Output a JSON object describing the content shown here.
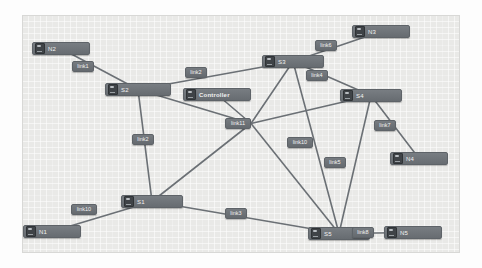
{
  "canvas": {
    "title": "network-topology-canvas",
    "background_color": "#e9e9e7",
    "node_color": "#6f7479",
    "edge_color": "#6b7075"
  },
  "nodes": [
    {
      "id": "N2",
      "label": "N2",
      "type": "host",
      "icon": "host-icon",
      "x": 10,
      "y": 27,
      "w": 58
    },
    {
      "id": "S2",
      "label": "S2",
      "type": "switch",
      "icon": "switch-icon",
      "x": 83,
      "y": 68,
      "w": 66
    },
    {
      "id": "S3",
      "label": "S3",
      "type": "switch",
      "icon": "switch-icon",
      "x": 240,
      "y": 40,
      "w": 62
    },
    {
      "id": "N3",
      "label": "N3",
      "type": "host",
      "icon": "host-icon",
      "x": 330,
      "y": 10,
      "w": 58
    },
    {
      "id": "Controller",
      "label": "Controller",
      "type": "controller",
      "icon": "controller-icon",
      "x": 161,
      "y": 73,
      "w": 68
    },
    {
      "id": "S4",
      "label": "S4",
      "type": "switch",
      "icon": "switch-icon",
      "x": 318,
      "y": 74,
      "w": 62
    },
    {
      "id": "N4",
      "label": "N4",
      "type": "host",
      "icon": "host-icon",
      "x": 368,
      "y": 137,
      "w": 58
    },
    {
      "id": "S1",
      "label": "S1",
      "type": "switch",
      "icon": "switch-icon",
      "x": 99,
      "y": 180,
      "w": 62
    },
    {
      "id": "N1",
      "label": "N1",
      "type": "host",
      "icon": "host-icon",
      "x": 1,
      "y": 210,
      "w": 58
    },
    {
      "id": "S5",
      "label": "S5",
      "type": "switch",
      "icon": "switch-icon",
      "x": 286,
      "y": 212,
      "w": 62
    },
    {
      "id": "N5",
      "label": "N5",
      "type": "host",
      "icon": "host-icon",
      "x": 362,
      "y": 211,
      "w": 58
    }
  ],
  "links": [
    {
      "id": "link1",
      "label": "link1",
      "from": "N2",
      "to": "S2",
      "lx": 50,
      "ly": 46
    },
    {
      "id": "link2",
      "label": "link2",
      "from": "S2",
      "to": "S3",
      "lx": 163,
      "ly": 52
    },
    {
      "id": "link6",
      "label": "link6",
      "from": "S3",
      "to": "N3",
      "lx": 293,
      "ly": 25
    },
    {
      "id": "link4",
      "label": "link4",
      "from": "S3",
      "to": "S4",
      "lx": 284,
      "ly": 55
    },
    {
      "id": "link7",
      "label": "link7",
      "from": "S4",
      "to": "N4",
      "lx": 352,
      "ly": 105
    },
    {
      "id": "link12",
      "label": "link2",
      "from": "S2",
      "to": "S1",
      "lx": 110,
      "ly": 119
    },
    {
      "id": "link10",
      "label": "link10",
      "from": "N1",
      "to": "S1",
      "lx": 49,
      "ly": 189
    },
    {
      "id": "link3",
      "label": "link3",
      "from": "S1",
      "to": "S5",
      "lx": 203,
      "ly": 193
    },
    {
      "id": "link8",
      "label": "link8",
      "from": "S5",
      "to": "N5",
      "lx": 330,
      "ly": 212
    },
    {
      "id": "link11",
      "label": "link11",
      "from": "hub",
      "to": "hub",
      "lx": 203,
      "ly": 103
    },
    {
      "id": "link10b",
      "label": "link10",
      "from": "S3",
      "to": "S5",
      "lx": 265,
      "ly": 122
    },
    {
      "id": "link5",
      "label": "link5",
      "from": "S4",
      "to": "S5",
      "lx": 302,
      "ly": 142
    }
  ],
  "edges": [
    {
      "from": "N2",
      "to": "S2"
    },
    {
      "from": "S2",
      "to": "S3"
    },
    {
      "from": "S3",
      "to": "N3"
    },
    {
      "from": "S3",
      "to": "S4"
    },
    {
      "from": "S4",
      "to": "N4"
    },
    {
      "from": "S2",
      "to": "S1"
    },
    {
      "from": "N1",
      "to": "S1"
    },
    {
      "from": "S1",
      "to": "S5"
    },
    {
      "from": "S5",
      "to": "N5"
    },
    {
      "from": "S2",
      "to": "hub"
    },
    {
      "from": "Controller",
      "to": "hub"
    },
    {
      "from": "S3",
      "to": "hub"
    },
    {
      "from": "S4",
      "to": "hub"
    },
    {
      "from": "S1",
      "to": "hub"
    },
    {
      "from": "S5",
      "to": "hub"
    },
    {
      "from": "S3",
      "to": "S5"
    },
    {
      "from": "S4",
      "to": "S5"
    }
  ]
}
